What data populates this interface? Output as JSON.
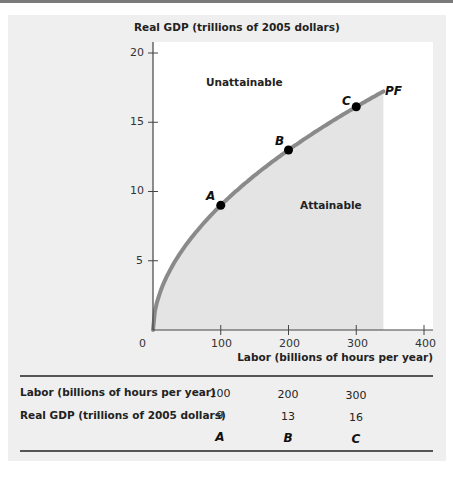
{
  "chart_data": {
    "type": "line",
    "title": "",
    "xlabel": "Labor (billions of hours per year)",
    "ylabel": "Real GDP (trillions of 2005 dollars)",
    "xlim": [
      0,
      400
    ],
    "ylim": [
      0,
      20
    ],
    "x_ticks": [
      0,
      100,
      200,
      300,
      400
    ],
    "y_ticks": [
      0,
      5,
      10,
      15,
      20
    ],
    "grid": false,
    "series": [
      {
        "name": "PF",
        "description": "Production function",
        "x": [
          0,
          100,
          200,
          300,
          340
        ],
        "y": [
          0,
          9,
          13,
          16,
          16.8
        ],
        "color": "#8a8a8a"
      }
    ],
    "points": [
      {
        "label": "A",
        "x": 100,
        "y": 9
      },
      {
        "label": "B",
        "x": 200,
        "y": 13
      },
      {
        "label": "C",
        "x": 300,
        "y": 16
      }
    ],
    "annotations": [
      {
        "text": "Unattainable",
        "region": "above curve"
      },
      {
        "text": "Attainable",
        "region": "below curve (shaded)"
      },
      {
        "text": "PF",
        "position": "curve end"
      }
    ],
    "table": {
      "rows": [
        {
          "label": "Labor (billions of hours per year)",
          "values": [
            "100",
            "200",
            "300"
          ]
        },
        {
          "label": "Real GDP (trillions of 2005 dollars)",
          "values": [
            "9",
            "13",
            "16"
          ]
        },
        {
          "label": "",
          "values": [
            "A",
            "B",
            "C"
          ]
        }
      ]
    }
  },
  "labels": {
    "y_axis_title": "Real GDP (trillions of 2005 dollars)",
    "x_axis_title": "Labor (billions of hours per year)",
    "unattainable": "Unattainable",
    "attainable": "Attainable",
    "pf": "PF",
    "x_tick_labels": [
      "0",
      "100",
      "200",
      "300",
      "400"
    ],
    "y_tick_labels": [
      "5",
      "10",
      "15",
      "20"
    ],
    "point_labels": [
      "A",
      "B",
      "C"
    ]
  },
  "colors": {
    "panel_bg": "#efefef",
    "plot_bg": "#ffffff",
    "attainable_fill": "#e4e4e4",
    "curve": "#8a8a8a",
    "axis": "#444444",
    "point": "#000000"
  }
}
